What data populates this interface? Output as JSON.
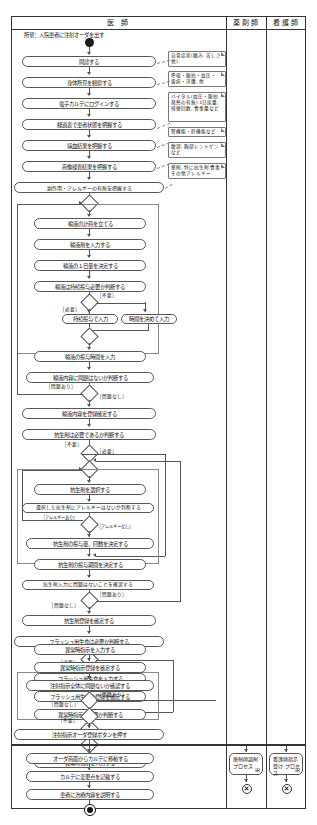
{
  "diagram": {
    "goal_text": "所望：入院患者に注射オーダを出す",
    "lanes": [
      {
        "id": "doctor",
        "label": "医 師"
      },
      {
        "id": "pharmacist",
        "label": "薬剤師"
      },
      {
        "id": "nurse",
        "label": "看護師"
      }
    ],
    "activities": [
      {
        "id": "a01",
        "label": "問診する"
      },
      {
        "id": "a02",
        "label": "身体所見を観察する"
      },
      {
        "id": "a03",
        "label": "電子カルテにログインする"
      },
      {
        "id": "a04",
        "label": "経過表で患者状態を把握する"
      },
      {
        "id": "a05",
        "label": "採血結果を把握する"
      },
      {
        "id": "a06",
        "label": "画像検査結果を把握する"
      },
      {
        "id": "a07",
        "label": "副作用・アレルギーの有無を把握する"
      },
      {
        "id": "a08",
        "label": "輸液の計画を立てる"
      },
      {
        "id": "a09",
        "label": "輸液剤を入力する"
      },
      {
        "id": "a10",
        "label": "輸液の１日量を決定する"
      },
      {
        "id": "a11",
        "label": "輸液は持続投与必要か判断する"
      },
      {
        "id": "a12",
        "label": "持続投与で入力"
      },
      {
        "id": "a13",
        "label": "時間を決めて入力"
      },
      {
        "id": "a14",
        "label": "輸液の投与時間を入力"
      },
      {
        "id": "a15",
        "label": "輸液内容に問題はないか判断する"
      },
      {
        "id": "a16",
        "label": "輸液内容を登録確定する"
      },
      {
        "id": "a17",
        "label": "抗生剤は必要であるか判断する"
      },
      {
        "id": "a18",
        "label": "抗生剤を選択する"
      },
      {
        "id": "a19",
        "label": "選択した抗生剤にアレルギーはないか判断する"
      },
      {
        "id": "a20",
        "label": "抗生剤の投与量、回数を決定する"
      },
      {
        "id": "a21",
        "label": "抗生剤の投与期間を決定する"
      },
      {
        "id": "a22",
        "label": "抗生剤入力に問題はないことを確認する"
      },
      {
        "id": "a23",
        "label": "抗生剤登録を確定する"
      },
      {
        "id": "a24",
        "label": "フラッシュ用生食は必要か判断する"
      },
      {
        "id": "a25",
        "label": "フラッシュ用生食を入力する"
      },
      {
        "id": "a26",
        "label": "フラッシュ用生食の登録を確定する"
      },
      {
        "id": "a27",
        "label": "異常時指示は必要か判断する"
      },
      {
        "id": "a28",
        "label": "異常時指示を入力する"
      },
      {
        "id": "a29",
        "label": "異常時指示登録を確定する"
      },
      {
        "id": "a30",
        "label": "注射指示全体に問題ないか確認する"
      },
      {
        "id": "a31",
        "label": "注射指示オーダ登録ボタンを押す"
      },
      {
        "id": "a32",
        "label": "オーダ画面からカルテに移動する"
      },
      {
        "id": "a33",
        "label": "カルテに変更点を記載する"
      },
      {
        "id": "a34",
        "label": "患者に治療内容を説明する"
      }
    ],
    "notes": [
      {
        "id": "n1",
        "text": "自覚症状(痛み, 苦しさ 他)"
      },
      {
        "id": "n2",
        "text": "呼吸・脈拍・血圧・ 黄疸・浮腫, 他"
      },
      {
        "id": "n3",
        "text": "バイタル(血圧・脈拍 発熱の有無) 1日尿量, 排便回数, 食事量など"
      },
      {
        "id": "n4",
        "text": "腎機能・肝機能など"
      },
      {
        "id": "n5",
        "text": "腹部, 胸部レントゲン など"
      },
      {
        "id": "n6",
        "text": "薬剤, 特に抗生剤 食事, その他アレルギー"
      }
    ],
    "guards": [
      {
        "id": "g1",
        "label": "［不要］"
      },
      {
        "id": "g2",
        "label": "［必要］"
      },
      {
        "id": "g3",
        "label": "［問題あり］"
      },
      {
        "id": "g4",
        "label": "［問題なし］"
      },
      {
        "id": "g5",
        "label": "［不要］"
      },
      {
        "id": "g6",
        "label": "［必要］"
      },
      {
        "id": "g7",
        "label": "［アレルギーあり］"
      },
      {
        "id": "g8",
        "label": "［アレルギーなし］"
      },
      {
        "id": "g9",
        "label": "［問題あり］"
      },
      {
        "id": "g10",
        "label": "［問題なし］"
      },
      {
        "id": "g11",
        "label": "［不要］"
      },
      {
        "id": "g12",
        "label": "［必要］"
      },
      {
        "id": "g13",
        "label": "［不要］"
      },
      {
        "id": "g14",
        "label": "［必要］"
      },
      {
        "id": "g15",
        "label": "［問題あり］"
      },
      {
        "id": "g16",
        "label": "［問題なし］"
      }
    ],
    "subprocesses": [
      {
        "id": "sp1",
        "lane": "pharmacist",
        "label": "薬剤師調剤 プロセス",
        "icon": "⊞"
      },
      {
        "id": "sp2",
        "lane": "nurse",
        "label": "看護師指示受け プロセス",
        "icon": "⊞"
      }
    ],
    "markers": {
      "start": "initial-node",
      "end": "final-node",
      "flow_final": "flow-final-node"
    }
  }
}
